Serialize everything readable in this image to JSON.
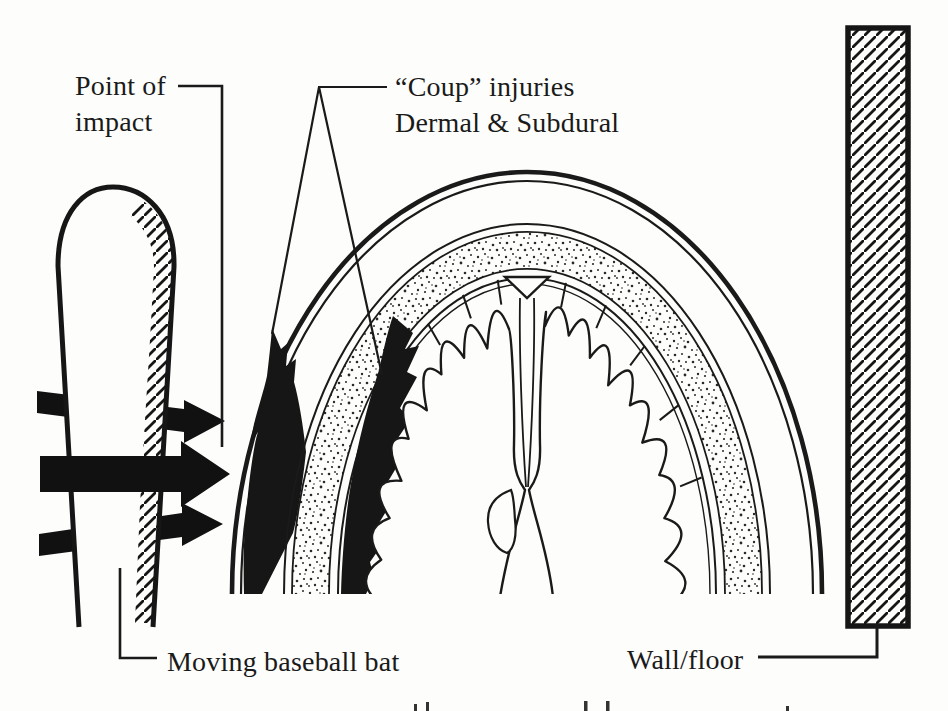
{
  "figure": {
    "type": "medical-illustration",
    "title_hint": "Coup injury mechanism diagram",
    "labels": {
      "point_of_impact": "Point of impact",
      "coup_line1": "“Coup” injuries",
      "coup_line2": "Dermal & Subdural",
      "moving_bat": "Moving baseball bat",
      "wall_floor": "Wall/floor"
    },
    "colors": {
      "ink": "#1a1a1a",
      "paper": "#fdfdfb",
      "injury_fill": "#161616",
      "stipple_dot": "#2a2a2a"
    },
    "parts": {
      "bat": "moving-baseball-bat",
      "impact_arrows": "impact-force-arrows",
      "head": "head-coronal-cross-section",
      "scalp": "scalp-layers",
      "skull": "stippled-skull-band",
      "dermal_injury": "coup-dermal-injury",
      "subdural_injury": "coup-subdural-hematoma",
      "brain": "brain-gyri",
      "falx": "falx-cerebri",
      "wall": "wall-floor-slab"
    }
  }
}
